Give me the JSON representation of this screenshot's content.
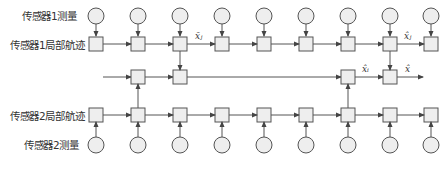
{
  "diagram": {
    "labels": {
      "sensor1_measurement": "传感器1测量",
      "sensor1_local_track": "传感器1局部航迹",
      "sensor2_local_track": "传感器2局部航迹",
      "sensor2_measurement": "传感器2测量"
    },
    "math_labels": {
      "prior_estimate": "x̄ⱼ",
      "local_estimate_j": "x̂ⱼ",
      "local_estimate_i": "x̂ᵢ",
      "fused_estimate": "x̂"
    },
    "columns": 9,
    "colors": {
      "stroke": "#555555",
      "node_fill": "#eeeeee"
    }
  }
}
